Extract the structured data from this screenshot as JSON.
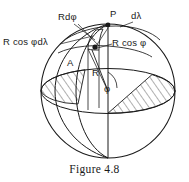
{
  "figure": {
    "caption": "Figure 4.8"
  },
  "colors": {
    "stroke": "#1a1a1a",
    "hatch": "#3a3a3a",
    "background": "#ffffff",
    "text": "#1a1a1a"
  },
  "labels": {
    "r_d_phi": "Rdφ",
    "d_lambda": "dλ",
    "point_p": "P",
    "r_cos_phi": "R cos φ",
    "r_cos_phi_d_lambda": "R cos φdλ",
    "point_a": "A",
    "radius_r": "R",
    "angle_phi": "φ"
  },
  "elements": {
    "sphere": "sphere-outline",
    "polar_axis": "polar-axis-line",
    "equatorial_disk": "equatorial-plane-hatched",
    "meridian_front": "meridian-arc-front",
    "meridian_back": "meridian-arc-back",
    "parallel_arc": "latitude-parallel-arc",
    "surface_patch": "differential-surface-element",
    "point_p_marker": "point-p-dot",
    "point_a_marker": "point-a-dot"
  }
}
